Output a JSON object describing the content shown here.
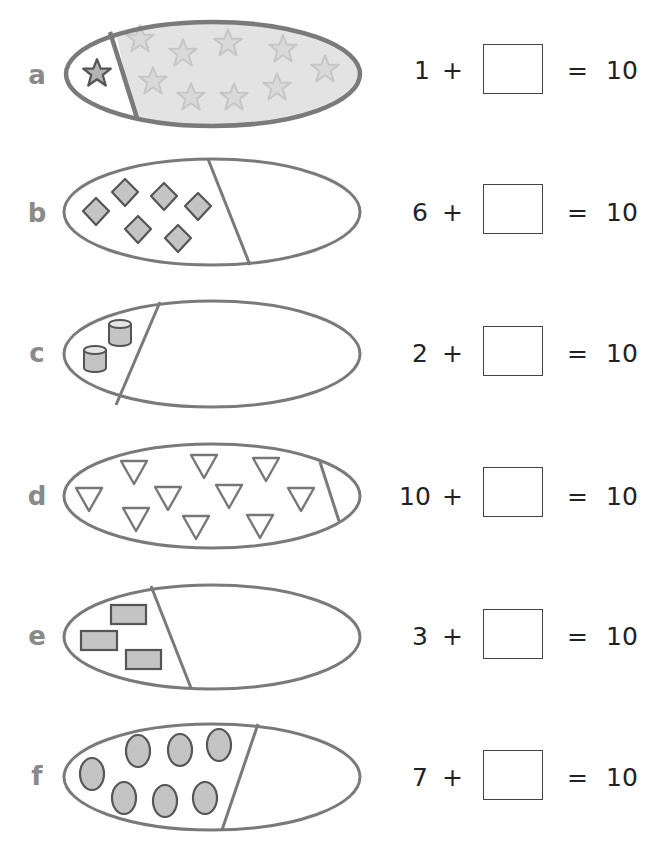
{
  "colors": {
    "outline": "#777777",
    "shape_fill": "#c4c4c4",
    "shape_stroke": "#555555",
    "shaded_region": "#e3e3e3",
    "faint_star": "#c8c8c8",
    "label": "#8a8a8a",
    "text": "#222222"
  },
  "rows": [
    {
      "label": "a",
      "shape": "star",
      "count_left": 1,
      "count_right_faint": 9,
      "addend": "1",
      "plus": "+",
      "equals": "=",
      "total": "10",
      "answer": ""
    },
    {
      "label": "b",
      "shape": "diamond",
      "count_left": 6,
      "addend": "6",
      "plus": "+",
      "equals": "=",
      "total": "10",
      "answer": ""
    },
    {
      "label": "c",
      "shape": "cylinder",
      "count_left": 2,
      "addend": "2",
      "plus": "+",
      "equals": "=",
      "total": "10",
      "answer": ""
    },
    {
      "label": "d",
      "shape": "triangle",
      "count_left": 10,
      "addend": "10",
      "plus": "+",
      "equals": "=",
      "total": "10",
      "answer": ""
    },
    {
      "label": "e",
      "shape": "rectangle",
      "count_left": 3,
      "addend": "3",
      "plus": "+",
      "equals": "=",
      "total": "10",
      "answer": ""
    },
    {
      "label": "f",
      "shape": "oval",
      "count_left": 7,
      "addend": "7",
      "plus": "+",
      "equals": "=",
      "total": "10",
      "answer": ""
    }
  ]
}
